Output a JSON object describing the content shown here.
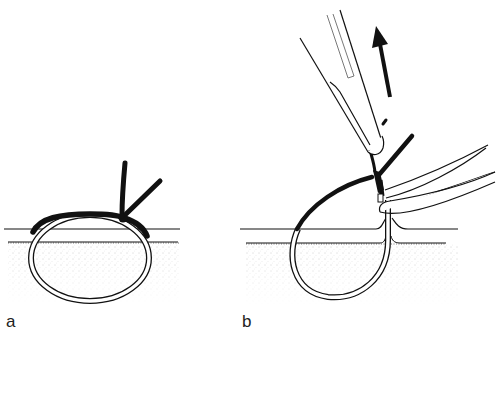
{
  "figure": {
    "panels": [
      {
        "id": "a",
        "label": "a",
        "description": "suture loop through skin with knot tied on surface, two free ends"
      },
      {
        "id": "b",
        "label": "b",
        "description": "needle holder pulling suture end upward while forceps hold the loop at skin exit"
      }
    ],
    "arrow": {
      "direction": "up",
      "panel": "b"
    },
    "colors": {
      "ink": "#111111",
      "stipple": "#9a9a9a",
      "background": "#ffffff"
    }
  }
}
